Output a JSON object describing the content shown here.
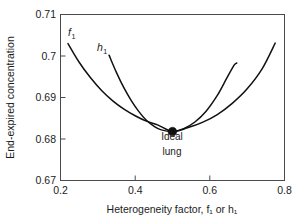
{
  "chart_data": {
    "type": "line",
    "title": "",
    "xlabel": "Heterogeneity factor, f₁ or h₁",
    "ylabel": "End-expired concentration",
    "xlim": [
      0.2,
      0.8
    ],
    "ylim": [
      0.67,
      0.71
    ],
    "xticks": [
      0.2,
      0.4,
      0.6,
      0.8
    ],
    "xticklabels": [
      "0.2",
      "0.4",
      "0.6",
      "0.8"
    ],
    "yticks": [
      0.67,
      0.68,
      0.69,
      0.7,
      0.71
    ],
    "yticklabels": [
      "0.67",
      "0.68",
      "0.69",
      "0.7",
      "0.71"
    ],
    "grid": false,
    "legend": "inline-curve-labels",
    "series": [
      {
        "name": "f1",
        "label": "f",
        "label_sub": "1",
        "x": [
          0.22,
          0.25,
          0.28,
          0.31,
          0.34,
          0.37,
          0.4,
          0.43,
          0.46,
          0.5,
          0.54,
          0.58,
          0.62,
          0.66,
          0.7,
          0.74,
          0.775
        ],
        "y": [
          0.703,
          0.6985,
          0.6948,
          0.6917,
          0.6892,
          0.6872,
          0.6856,
          0.6843,
          0.6834,
          0.6818,
          0.6827,
          0.684,
          0.6859,
          0.6886,
          0.6921,
          0.6969,
          0.7031
        ]
      },
      {
        "name": "h1",
        "label": "h",
        "label_sub": "1",
        "x": [
          0.33,
          0.35,
          0.37,
          0.39,
          0.41,
          0.43,
          0.45,
          0.47,
          0.5,
          0.53,
          0.56,
          0.59,
          0.62,
          0.645,
          0.665,
          0.672
        ],
        "y": [
          0.7002,
          0.696,
          0.6923,
          0.6892,
          0.6866,
          0.6845,
          0.6831,
          0.6822,
          0.6818,
          0.6825,
          0.6841,
          0.6867,
          0.6905,
          0.6946,
          0.6978,
          0.6983
        ]
      }
    ],
    "annotations": [
      {
        "name": "ideal-lung",
        "text_line1": "Ideal",
        "text_line2": "lung",
        "point_x": 0.5,
        "point_y": 0.6818,
        "marker": "filled-circle",
        "marker_color": "#111111"
      }
    ]
  }
}
